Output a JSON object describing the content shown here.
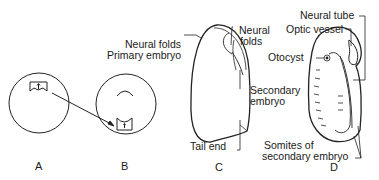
{
  "figure": {
    "panels": [
      {
        "id": "A",
        "label": "A"
      },
      {
        "id": "B",
        "label": "B"
      },
      {
        "id": "C",
        "label": "C"
      },
      {
        "id": "D",
        "label": "D"
      }
    ],
    "labels": {
      "b_neural_folds": "Neural folds",
      "b_primary_embryo": "Primary embryo",
      "c_neural_folds_1": "Neural",
      "c_neural_folds_2": "folds",
      "c_secondary_embryo_1": "Secondary",
      "c_secondary_embryo_2": "embryo",
      "c_tail_end": "Tail end",
      "d_neural_tube": "Neural tube",
      "d_optic_vessel": "Optic vessel",
      "d_otocyst": "Otocyst",
      "d_somites_1": "Somites of",
      "d_somites_2": "secondary embryo"
    },
    "colors": {
      "line": "#222222",
      "background": "#ffffff"
    }
  }
}
